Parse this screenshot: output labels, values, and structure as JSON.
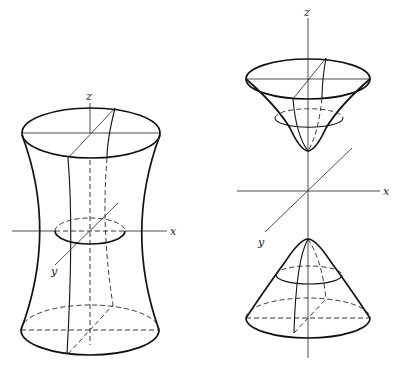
{
  "figures": [
    {
      "name": "hyperboloid-one-sheet",
      "axis_labels": {
        "x": "x",
        "y": "y",
        "z": "z"
      }
    },
    {
      "name": "hyperboloid-two-sheets",
      "axis_labels": {
        "x": "x",
        "y": "y",
        "z": "z"
      }
    }
  ],
  "colors": {
    "ink": "#111111",
    "background": "#ffffff"
  }
}
